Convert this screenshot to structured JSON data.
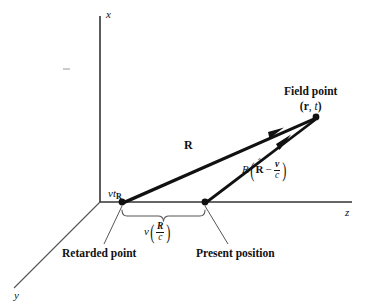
{
  "figure": {
    "type": "physics-vector-diagram",
    "background_color": "#ffffff",
    "ink_color": "#111111",
    "thin_line_color": "#555555"
  },
  "axes": {
    "x_label": "x",
    "y_label": "y",
    "z_label": "z",
    "origin": {
      "x": 100,
      "y": 202
    },
    "x_axis_end": {
      "x": 100,
      "y": 16
    },
    "y_axis_end": {
      "x": 14,
      "y": 288
    },
    "z_axis_end": {
      "x": 352,
      "y": 202
    }
  },
  "points": {
    "retarded": {
      "label": "Retarded point",
      "coords": {
        "x": 122,
        "y": 202
      }
    },
    "present": {
      "label": "Present position",
      "coords": {
        "x": 205,
        "y": 202
      }
    },
    "field": {
      "label_line1": "Field point",
      "label_line2_r": "r",
      "label_line2_comma": ", ",
      "label_line2_t": "t",
      "coords": {
        "x": 316,
        "y": 117
      }
    }
  },
  "vectors": {
    "R": {
      "label": "R",
      "from": "retarded",
      "to": "field",
      "label_pos": {
        "x": 188,
        "y": 145
      }
    },
    "R_minus_v_over_c": {
      "label_R": "R",
      "label_Rhat": "R",
      "label_hat": "ˆ",
      "label_minus": "−",
      "frac_numerator": "v",
      "frac_denominator": "c",
      "from": "present",
      "to": "field",
      "label_pos": {
        "x": 250,
        "y": 163
      }
    }
  },
  "annotations": {
    "displacement_axis_label": {
      "v": "v",
      "t": "t",
      "subscript": "R"
    },
    "brace_label": {
      "v": "v",
      "frac_numerator": "R",
      "frac_denominator": "c"
    }
  }
}
